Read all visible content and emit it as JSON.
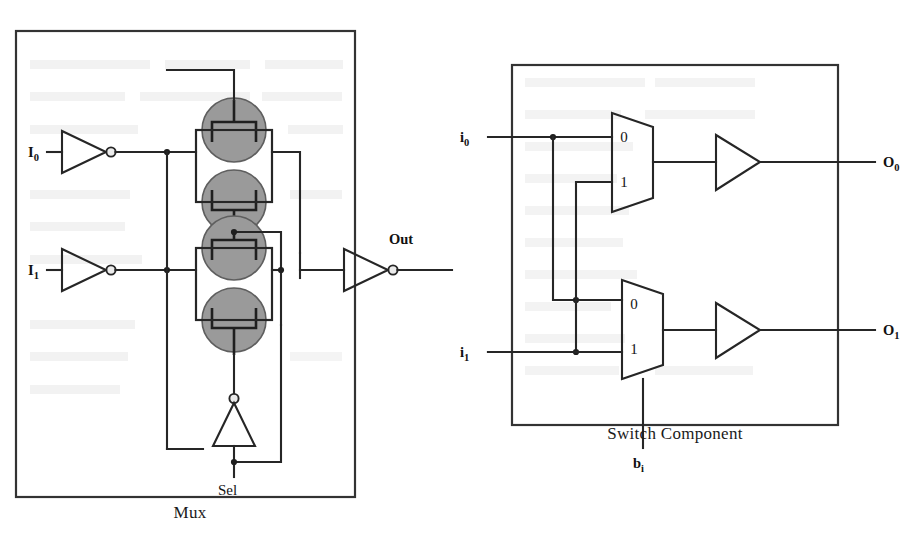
{
  "page": {
    "background_color": "#ffffff",
    "width": 914,
    "height": 544
  },
  "figures": [
    {
      "id": "mux-figure",
      "caption": "Mux",
      "panel_fill": "#e8e8e8",
      "panel_border": "#333333",
      "description": "CMOS transmission-gate 2-to-1 multiplexer schematic",
      "labels": {
        "input_0": "I",
        "input_0_sub": "0",
        "input_1": "I",
        "input_1_sub": "1",
        "select": "Sel",
        "output": "Out"
      },
      "components": [
        {
          "name": "inverter-i0",
          "type": "inverter"
        },
        {
          "name": "inverter-i1",
          "type": "inverter"
        },
        {
          "name": "transmission-gate-top",
          "type": "transmission-gate"
        },
        {
          "name": "transmission-gate-bottom",
          "type": "transmission-gate"
        },
        {
          "name": "inverter-sel",
          "type": "inverter"
        },
        {
          "name": "inverter-out",
          "type": "inverter"
        }
      ]
    },
    {
      "id": "switch-component-figure",
      "caption": "Switch Component",
      "panel_fill": "#e8e8e8",
      "panel_border": "#333333",
      "description": "Two 2-to-1 multiplexers with buffers forming a crossbar switch",
      "labels": {
        "input_0": "i",
        "input_0_sub": "0",
        "input_1": "i",
        "input_1_sub": "1",
        "select": "b",
        "select_sub": "i",
        "output_0": "O",
        "output_0_sub": "0",
        "output_1": "O",
        "output_1_sub": "1"
      },
      "mux_top": {
        "name": "mux-top",
        "port_labels": [
          "0",
          "1"
        ]
      },
      "mux_bottom": {
        "name": "mux-bottom",
        "port_labels": [
          "0",
          "1"
        ]
      },
      "components": [
        {
          "name": "buffer-top",
          "type": "buffer"
        },
        {
          "name": "buffer-bottom",
          "type": "buffer"
        }
      ]
    }
  ]
}
